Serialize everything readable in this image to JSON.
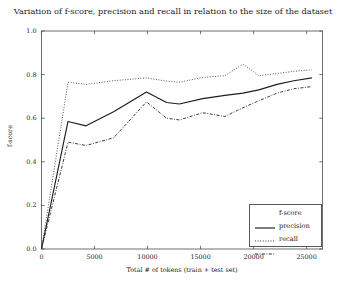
{
  "chart_data": {
    "type": "line",
    "title": "Variation of f-score, precision and recall in relation to the size of the dataset",
    "xlabel": "Total # of tokens (train + test set)",
    "ylabel": "f-score",
    "xlim": [
      0,
      26500
    ],
    "ylim": [
      0.0,
      1.0
    ],
    "grid": false,
    "legend_position": "lower right",
    "xticks": [
      0,
      5000,
      10000,
      15000,
      20000,
      25000
    ],
    "xtick_labels": [
      "0",
      "5000",
      "10000",
      "15000",
      "20000",
      "25000"
    ],
    "yticks": [
      0.0,
      0.2,
      0.4,
      0.6,
      0.8,
      1.0
    ],
    "ytick_labels": [
      "0.0",
      "0.2",
      "0.4",
      "0.6",
      "0.8",
      "1.0"
    ],
    "x": [
      0,
      2500,
      4200,
      6800,
      9900,
      11800,
      13000,
      15200,
      17300,
      19000,
      20500,
      22200,
      23800,
      25500
    ],
    "series": [
      {
        "name": "f-score",
        "style": "solid",
        "color": "#1d1d1d",
        "values": [
          0.0,
          0.585,
          0.565,
          0.63,
          0.72,
          0.672,
          0.665,
          0.69,
          0.705,
          0.715,
          0.73,
          0.755,
          0.772,
          0.785
        ]
      },
      {
        "name": "precision",
        "style": "dotted",
        "color": "#3c3c3c",
        "values": [
          0.0,
          0.765,
          0.755,
          0.772,
          0.785,
          0.77,
          0.765,
          0.787,
          0.795,
          0.848,
          0.795,
          0.805,
          0.815,
          0.822
        ]
      },
      {
        "name": "recall",
        "style": "dashdot",
        "color": "#2e2e2e",
        "values": [
          0.0,
          0.49,
          0.475,
          0.51,
          0.675,
          0.6,
          0.592,
          0.625,
          0.608,
          0.648,
          0.68,
          0.715,
          0.735,
          0.745
        ]
      }
    ],
    "legend_entries": [
      {
        "label": "f-score",
        "style": "solid"
      },
      {
        "label": "precision",
        "style": "dotted"
      },
      {
        "label": "recall",
        "style": "dashdot"
      }
    ]
  },
  "colors": {
    "axis": "#4b4b4b",
    "background": "#ffffff",
    "text": "#1a1a1a"
  }
}
